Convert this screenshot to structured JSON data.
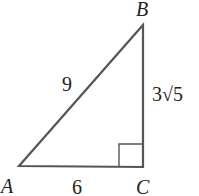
{
  "diagram": {
    "type": "right-triangle",
    "vertices": {
      "A": {
        "label": "A"
      },
      "B": {
        "label": "B"
      },
      "C": {
        "label": "C"
      }
    },
    "sides": {
      "AB": {
        "label": "9"
      },
      "AC": {
        "label": "6"
      },
      "BC": {
        "label": "3√5"
      }
    },
    "right_angle_at": "C",
    "colors": {
      "stroke": "#555555",
      "text": "#222222"
    }
  }
}
